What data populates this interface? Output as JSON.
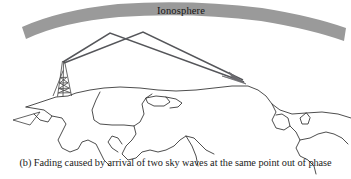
{
  "figure": {
    "caption": "(b) Fading caused by arrival of two sky waves at the same point out of phase",
    "label_part": "(b)"
  },
  "diagram": {
    "type": "radio-propagation-schematic",
    "ionosphere": {
      "label": "Ionosphere",
      "fill_color": "#9a9a9a",
      "shape": "curved-arc-band",
      "left_x": 22,
      "right_x": 345,
      "apex_y": 12,
      "band_thickness": 19
    },
    "transmitter": {
      "name": "transmitter-antenna-tower",
      "base_x": 66,
      "base_y": 97,
      "top_x": 63,
      "top_y": 61,
      "stroke_color": "#4a4a4a"
    },
    "receiver": {
      "name": "reception-point",
      "x": 244,
      "y": 83,
      "arrowhead": true
    },
    "sky_waves": [
      {
        "name": "sky-wave-path-1",
        "reflection_x": 110,
        "reflection_y": 33,
        "stroke_color": "#55565a",
        "stroke_width": 1.4
      },
      {
        "name": "sky-wave-path-2",
        "reflection_x": 143,
        "reflection_y": 32,
        "stroke_color": "#55565a",
        "stroke_width": 1.4
      }
    ],
    "terrain": {
      "name": "earth-surface-outline",
      "stroke_color": "#2e2e2e",
      "stroke_width": 0.8,
      "fill": "none"
    }
  }
}
